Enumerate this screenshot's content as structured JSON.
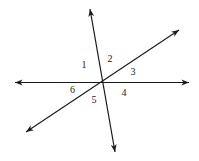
{
  "diagram": {
    "intersection": {
      "x": 102.5,
      "y": 82
    },
    "lines": [
      {
        "name": "horizontal-line",
        "x1": 15,
        "y1": 82.5,
        "x2": 189,
        "y2": 82.5
      },
      {
        "name": "steep-line",
        "x1": 90,
        "y1": 9,
        "x2": 115,
        "y2": 152
      },
      {
        "name": "diagonal-line",
        "x1": 26,
        "y1": 132,
        "x2": 179,
        "y2": 30
      }
    ],
    "labels": [
      {
        "text": "1",
        "x": 84,
        "y": 68
      },
      {
        "text": "2",
        "x": 110,
        "y": 62
      },
      {
        "text": "3",
        "x": 133,
        "y": 75
      },
      {
        "text": "4",
        "x": 124,
        "y": 96
      },
      {
        "text": "5",
        "x": 94,
        "y": 103
      },
      {
        "text": "6",
        "x": 72.5,
        "y": 93
      }
    ],
    "colors": {
      "line": "#1a1a1a",
      "label": "#222222",
      "background": "#ffffff"
    }
  }
}
